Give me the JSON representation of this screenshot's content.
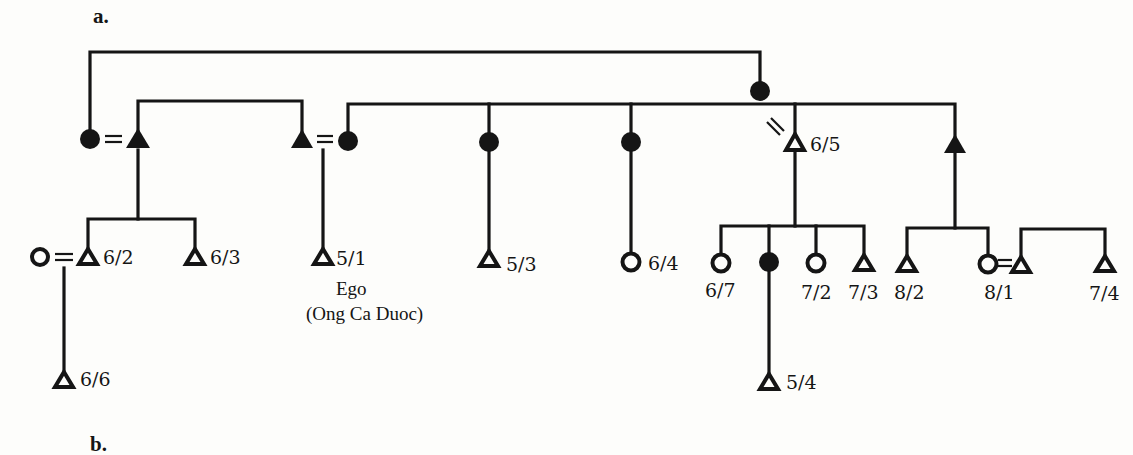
{
  "figure": {
    "panel_label": "a.",
    "next_panel_label_partial": "b.",
    "ego_label": "Ego",
    "ego_name": "(Ong Ca Duoc)",
    "colors": {
      "ink": "#151515",
      "background": "#fdfdfb"
    }
  },
  "legend_semantics": {
    "triangle": "male",
    "circle": "female",
    "filled": "deceased / not living",
    "hollow": "living",
    "double_line": "marriage",
    "slashed_double_line": "divorce / separation"
  },
  "people": [
    {
      "id": "top-female",
      "sex": "female",
      "filled": true,
      "label": ""
    },
    {
      "id": "gen1-female-left",
      "sex": "female",
      "filled": true,
      "label": ""
    },
    {
      "id": "gen1-male-left",
      "sex": "male",
      "filled": true,
      "label": ""
    },
    {
      "id": "gen1-male-mid",
      "sex": "male",
      "filled": true,
      "label": ""
    },
    {
      "id": "gen1-female-mid",
      "sex": "female",
      "filled": true,
      "label": ""
    },
    {
      "id": "gen1-female-3",
      "sex": "female",
      "filled": true,
      "label": ""
    },
    {
      "id": "gen1-female-4",
      "sex": "female",
      "filled": true,
      "label": ""
    },
    {
      "id": "gen1-male-65",
      "sex": "male",
      "filled": false,
      "label": "6/5"
    },
    {
      "id": "gen1-male-right",
      "sex": "male",
      "filled": true,
      "label": ""
    },
    {
      "id": "wife-62",
      "sex": "female",
      "filled": false,
      "label": ""
    },
    {
      "id": "p-62",
      "sex": "male",
      "filled": false,
      "label": "6/2"
    },
    {
      "id": "p-63",
      "sex": "male",
      "filled": false,
      "label": "6/3"
    },
    {
      "id": "p-51",
      "sex": "male",
      "filled": false,
      "label": "5/1"
    },
    {
      "id": "p-53",
      "sex": "male",
      "filled": false,
      "label": "5/3"
    },
    {
      "id": "p-64",
      "sex": "female",
      "filled": false,
      "label": "6/4"
    },
    {
      "id": "p-67",
      "sex": "female",
      "filled": false,
      "label": "6/7"
    },
    {
      "id": "p-dec-f",
      "sex": "female",
      "filled": true,
      "label": ""
    },
    {
      "id": "p-72",
      "sex": "female",
      "filled": false,
      "label": "7/2"
    },
    {
      "id": "p-73",
      "sex": "male",
      "filled": false,
      "label": "7/3"
    },
    {
      "id": "p-82",
      "sex": "male",
      "filled": false,
      "label": "8/2"
    },
    {
      "id": "p-81",
      "sex": "female",
      "filled": false,
      "label": "8/1"
    },
    {
      "id": "husband-81",
      "sex": "male",
      "filled": false,
      "label": ""
    },
    {
      "id": "p-74",
      "sex": "male",
      "filled": false,
      "label": "7/4"
    },
    {
      "id": "p-66",
      "sex": "male",
      "filled": false,
      "label": "6/6"
    },
    {
      "id": "p-54",
      "sex": "male",
      "filled": false,
      "label": "5/4"
    }
  ],
  "labels": {
    "l62": "6/2",
    "l63": "6/3",
    "l51": "5/1",
    "l53": "5/3",
    "l64": "6/4",
    "l65": "6/5",
    "l67": "6/7",
    "l72": "7/2",
    "l73": "7/3",
    "l82": "8/2",
    "l81": "8/1",
    "l74": "7/4",
    "l66": "6/6",
    "l54": "5/4"
  }
}
